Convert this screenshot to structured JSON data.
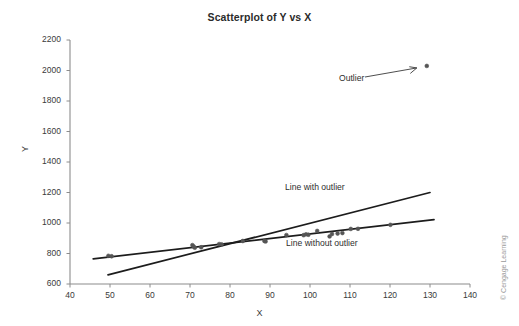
{
  "chart_data": {
    "type": "scatter",
    "title": "Scatterplot of Y vs X",
    "xlabel": "X",
    "ylabel": "Y",
    "xlim": [
      40,
      140
    ],
    "ylim": [
      600,
      2200
    ],
    "xticks": [
      40,
      50,
      60,
      70,
      80,
      90,
      100,
      110,
      120,
      130,
      140
    ],
    "yticks": [
      600,
      800,
      1000,
      1200,
      1400,
      1600,
      1800,
      2000,
      2200
    ],
    "grid": false,
    "legend": "none",
    "point_color": "#555555",
    "line_color": "#1c1c1c",
    "axis_color": "#8c8c8c",
    "points": [
      {
        "x": 49.6,
        "y": 785
      },
      {
        "x": 50.4,
        "y": 782
      },
      {
        "x": 70.6,
        "y": 855
      },
      {
        "x": 70.9,
        "y": 846
      },
      {
        "x": 71.2,
        "y": 838
      },
      {
        "x": 72.8,
        "y": 841
      },
      {
        "x": 77.3,
        "y": 862
      },
      {
        "x": 77.9,
        "y": 860
      },
      {
        "x": 83.2,
        "y": 882
      },
      {
        "x": 88.6,
        "y": 882
      },
      {
        "x": 88.9,
        "y": 879
      },
      {
        "x": 94.1,
        "y": 921
      },
      {
        "x": 98.4,
        "y": 920
      },
      {
        "x": 99.0,
        "y": 926
      },
      {
        "x": 99.6,
        "y": 923
      },
      {
        "x": 101.8,
        "y": 948
      },
      {
        "x": 104.9,
        "y": 912
      },
      {
        "x": 105.5,
        "y": 928
      },
      {
        "x": 106.9,
        "y": 931
      },
      {
        "x": 108.1,
        "y": 934
      },
      {
        "x": 110.2,
        "y": 961
      },
      {
        "x": 112.0,
        "y": 962
      },
      {
        "x": 120.1,
        "y": 988
      },
      {
        "x": 129.2,
        "y": 2030
      }
    ],
    "lines": [
      {
        "name": "Line with outlier",
        "label": "Line with outlier",
        "x0": 49.5,
        "y0": 660,
        "x1": 130.0,
        "y1": 1200
      },
      {
        "name": "Line without outlier",
        "label": "Line without outlier",
        "x0": 45.8,
        "y0": 765,
        "x1": 131.0,
        "y1": 1022
      }
    ],
    "annotations": [
      {
        "name": "outlier-annotation",
        "text": "Outlier",
        "target_x": 129.2,
        "target_y": 2030
      }
    ]
  },
  "labels": {
    "title": "Scatterplot of Y vs X",
    "x_axis": "X",
    "y_axis": "Y",
    "outlier": "Outlier",
    "line_with_outlier": "Line with outlier",
    "line_without_outlier": "Line without outlier",
    "copyright": "© Cengage Learning"
  }
}
